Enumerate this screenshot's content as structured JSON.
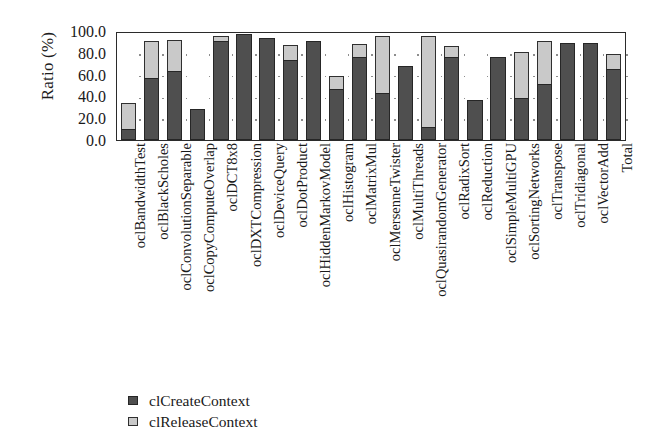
{
  "chart_data": {
    "type": "bar",
    "subtype": "stacked-vertical",
    "title": "",
    "xlabel": "",
    "ylabel": "Ratio (%)",
    "ylim": [
      0.0,
      100.0
    ],
    "ytick_step": 20.0,
    "ytick_labels": [
      "100.0",
      "80.0",
      "60.0",
      "40.0",
      "20.0",
      "0.0"
    ],
    "ytick_values": [
      100.0,
      80.0,
      60.0,
      40.0,
      20.0,
      0.0
    ],
    "grid": "dotted",
    "legend_position": "below-left",
    "categories": [
      "oclBandwidthTest",
      "oclBlackScholes",
      "oclConvolutionSeparable",
      "oclCopyComputeOverlap",
      "oclDCT8x8",
      "oclDXTCompression",
      "oclDeviceQuery",
      "oclDotProduct",
      "oclHiddenMarkovModel",
      "oclHistogram",
      "oclMatrixMul",
      "oclMersenneTwister",
      "oclMultiThreads",
      "oclQuasirandomGenerator",
      "oclRadixSort",
      "oclReduction",
      "oclSimpleMultiGPU",
      "oclSortingNetworks",
      "oclTranspose",
      "oclTridiagonal",
      "oclVectorAdd",
      "Total"
    ],
    "series": [
      {
        "name": "clCreateContext",
        "color": "#4f4f4f",
        "values": [
          10,
          57,
          63,
          28,
          91,
          97,
          94,
          73,
          91,
          47,
          76,
          43,
          68,
          12,
          76,
          37,
          76,
          39,
          51,
          89,
          89,
          65
        ]
      },
      {
        "name": "clReleaseContext",
        "color": "#c9c9c9",
        "values": [
          24,
          34,
          29,
          0,
          4,
          0,
          0,
          14,
          0,
          12,
          12,
          52,
          0,
          83,
          10,
          0,
          0,
          42,
          40,
          0,
          0,
          14
        ]
      }
    ],
    "totals": [
      34,
      91,
      92,
      28,
      95,
      97,
      94,
      87,
      91,
      59,
      88,
      95,
      68,
      95,
      86,
      37,
      76,
      81,
      91,
      89,
      89,
      79
    ]
  },
  "legend": {
    "entries": [
      {
        "label": "clCreateContext",
        "key": "create-swatch"
      },
      {
        "label": "clReleaseContext",
        "key": "release-swatch"
      }
    ]
  }
}
